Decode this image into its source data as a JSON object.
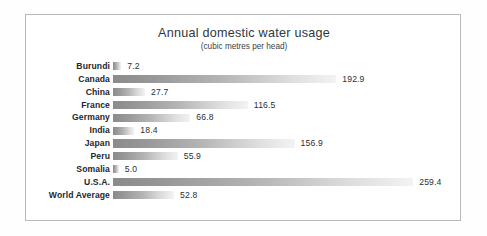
{
  "chart_data": {
    "type": "bar",
    "orientation": "horizontal",
    "title": "Annual domestic water usage",
    "subtitle": "(cubic metres per head)",
    "xlabel": "",
    "ylabel": "",
    "unit": "cubic metres per head",
    "grid": false,
    "legend": false,
    "show_axis": false,
    "data_labels": true,
    "xlim": [
      0,
      259.4
    ],
    "categories": [
      "Burundi",
      "Canada",
      "China",
      "France",
      "Germany",
      "India",
      "Japan",
      "Peru",
      "Somalia",
      "U.S.A.",
      "World Average"
    ],
    "values": [
      7.2,
      192.9,
      27.7,
      116.5,
      66.8,
      18.4,
      156.9,
      55.9,
      5.0,
      259.4,
      52.8
    ],
    "value_labels": [
      "7.2",
      "192.9",
      "27.7",
      "116.5",
      "66.8",
      "18.4",
      "156.9",
      "55.9",
      "5.0",
      "259.4",
      "52.8"
    ],
    "bar_gradient_start": "#8b8b8b",
    "bar_gradient_end": "#f3f3f3",
    "label_color": "#23272d",
    "value_color": "#2b2f35",
    "title_color": "#2f3640",
    "frame_color": "#b9b9b9",
    "background_color": "#ffffff"
  }
}
